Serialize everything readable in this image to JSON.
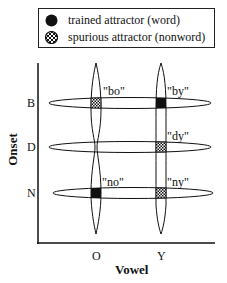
{
  "legend": {
    "items": [
      {
        "label": "trained attractor (word)",
        "marker": "filled-circle"
      },
      {
        "label": "spurious attractor (nonword)",
        "marker": "checkered-circle"
      }
    ]
  },
  "axes": {
    "ylabel": "Onset",
    "xlabel": "Vowel",
    "y_ticks": [
      "B",
      "D",
      "N"
    ],
    "x_ticks": [
      "O",
      "Y"
    ]
  },
  "attractors": [
    {
      "label": "\"bo\"",
      "onset": "B",
      "vowel": "O",
      "type": "spurious"
    },
    {
      "label": "\"by\"",
      "onset": "B",
      "vowel": "Y",
      "type": "trained"
    },
    {
      "label": "\"dy\"",
      "onset": "D",
      "vowel": "Y",
      "type": "spurious"
    },
    {
      "label": "\"no\"",
      "onset": "N",
      "vowel": "O",
      "type": "trained"
    },
    {
      "label": "\"ny\"",
      "onset": "N",
      "vowel": "Y",
      "type": "spurious"
    }
  ],
  "colors": {
    "ink": "#111111",
    "background": "#ffffff"
  }
}
